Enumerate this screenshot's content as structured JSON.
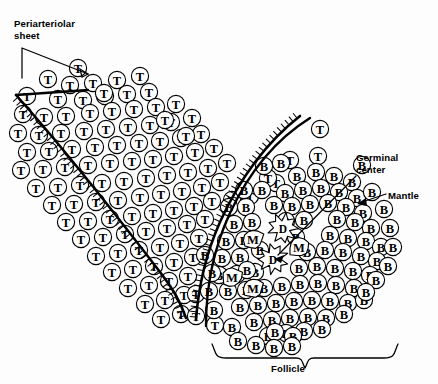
{
  "diagram": {
    "background_color": "#fdfdfd",
    "ink_color": "#000000",
    "width": 438,
    "height": 384
  },
  "labels": {
    "periarteriolar": "Periarteriolar\nsheet",
    "germinal_center": "Germinal\ncenter",
    "mantle": "Mantle",
    "follicle": "Follicle"
  },
  "legend_keys": {
    "T": "T lymphocyte",
    "B": "B lymphocyte",
    "M": "Macrophage",
    "D": "Dendritic cell"
  },
  "chart_data": {
    "type": "scatter",
    "xlabel": "",
    "ylabel": "",
    "xlim": [
      0,
      438
    ],
    "ylim": [
      0,
      384
    ],
    "grid": false,
    "legend_position": "none",
    "series": [
      {
        "name": "T lymphocyte",
        "marker": "circle",
        "label": "T",
        "radius": 8.6,
        "count": 118,
        "points": [
          [
            78,
            68
          ],
          [
            48,
            79
          ],
          [
            70,
            85
          ],
          [
            93,
            83
          ],
          [
            117,
            80
          ],
          [
            27,
            96
          ],
          [
            58,
            99
          ],
          [
            83,
            100
          ],
          [
            105,
            96
          ],
          [
            127,
            94
          ],
          [
            149,
            92
          ],
          [
            23,
            114
          ],
          [
            44,
            117
          ],
          [
            66,
            116
          ],
          [
            90,
            113
          ],
          [
            112,
            111
          ],
          [
            134,
            109
          ],
          [
            156,
            107
          ],
          [
            176,
            104
          ],
          [
            18,
            133
          ],
          [
            39,
            135
          ],
          [
            61,
            133
          ],
          [
            84,
            131
          ],
          [
            106,
            129
          ],
          [
            128,
            127
          ],
          [
            150,
            125
          ],
          [
            171,
            122
          ],
          [
            192,
            118
          ],
          [
            27,
            152
          ],
          [
            49,
            151
          ],
          [
            72,
            149
          ],
          [
            95,
            147
          ],
          [
            117,
            145
          ],
          [
            139,
            143
          ],
          [
            160,
            141
          ],
          [
            181,
            138
          ],
          [
            201,
            134
          ],
          [
            21,
            170
          ],
          [
            43,
            169
          ],
          [
            65,
            167
          ],
          [
            88,
            165
          ],
          [
            110,
            163
          ],
          [
            132,
            161
          ],
          [
            153,
            159
          ],
          [
            174,
            156
          ],
          [
            195,
            152
          ],
          [
            214,
            148
          ],
          [
            36,
            188
          ],
          [
            58,
            187
          ],
          [
            80,
            185
          ],
          [
            102,
            183
          ],
          [
            124,
            181
          ],
          [
            146,
            178
          ],
          [
            167,
            175
          ],
          [
            188,
            172
          ],
          [
            208,
            168
          ],
          [
            227,
            163
          ],
          [
            52,
            205
          ],
          [
            74,
            204
          ],
          [
            96,
            202
          ],
          [
            118,
            200
          ],
          [
            140,
            197
          ],
          [
            161,
            194
          ],
          [
            182,
            191
          ],
          [
            202,
            187
          ],
          [
            220,
            182
          ],
          [
            66,
            222
          ],
          [
            88,
            221
          ],
          [
            110,
            219
          ],
          [
            132,
            216
          ],
          [
            153,
            213
          ],
          [
            174,
            210
          ],
          [
            194,
            206
          ],
          [
            212,
            201
          ],
          [
            81,
            239
          ],
          [
            103,
            237
          ],
          [
            125,
            234
          ],
          [
            146,
            231
          ],
          [
            167,
            228
          ],
          [
            187,
            224
          ],
          [
            205,
            219
          ],
          [
            96,
            256
          ],
          [
            118,
            253
          ],
          [
            139,
            250
          ],
          [
            160,
            247
          ],
          [
            180,
            243
          ],
          [
            199,
            238
          ],
          [
            112,
            272
          ],
          [
            133,
            269
          ],
          [
            154,
            266
          ],
          [
            174,
            262
          ],
          [
            193,
            257
          ],
          [
            128,
            288
          ],
          [
            149,
            285
          ],
          [
            169,
            281
          ],
          [
            188,
            276
          ],
          [
            145,
            304
          ],
          [
            165,
            300
          ],
          [
            184,
            295
          ],
          [
            161,
            319
          ],
          [
            181,
            314
          ],
          [
            104,
            93
          ],
          [
            140,
            76
          ],
          [
            165,
            120
          ],
          [
            186,
            136
          ],
          [
            320,
            129
          ],
          [
            318,
            156
          ],
          [
            290,
            160
          ],
          [
            276,
            183
          ],
          [
            196,
            294
          ],
          [
            196,
            316
          ],
          [
            215,
            325
          ],
          [
            232,
            200
          ],
          [
            250,
            196
          ],
          [
            268,
            178
          ]
        ]
      },
      {
        "name": "B lymphocyte",
        "marker": "circle",
        "label": "B",
        "radius": 8.6,
        "count": 96,
        "points": [
          [
            297,
            176
          ],
          [
            316,
            172
          ],
          [
            334,
            176
          ],
          [
            352,
            182
          ],
          [
            285,
            193
          ],
          [
            303,
            190
          ],
          [
            321,
            188
          ],
          [
            339,
            192
          ],
          [
            357,
            198
          ],
          [
            246,
            207
          ],
          [
            274,
            205
          ],
          [
            292,
            206
          ],
          [
            310,
            204
          ],
          [
            328,
            203
          ],
          [
            346,
            207
          ],
          [
            363,
            213
          ],
          [
            234,
            224
          ],
          [
            252,
            222
          ],
          [
            286,
            221
          ],
          [
            304,
            220
          ],
          [
            337,
            219
          ],
          [
            355,
            222
          ],
          [
            371,
            228
          ],
          [
            226,
            241
          ],
          [
            244,
            240
          ],
          [
            296,
            237
          ],
          [
            330,
            235
          ],
          [
            348,
            238
          ],
          [
            366,
            241
          ],
          [
            381,
            247
          ],
          [
            222,
            258
          ],
          [
            240,
            257
          ],
          [
            307,
            252
          ],
          [
            325,
            250
          ],
          [
            343,
            252
          ],
          [
            361,
            256
          ],
          [
            377,
            261
          ],
          [
            219,
            275
          ],
          [
            237,
            274
          ],
          [
            255,
            272
          ],
          [
            299,
            268
          ],
          [
            317,
            266
          ],
          [
            335,
            268
          ],
          [
            353,
            271
          ],
          [
            370,
            275
          ],
          [
            228,
            291
          ],
          [
            246,
            290
          ],
          [
            264,
            288
          ],
          [
            282,
            286
          ],
          [
            300,
            284
          ],
          [
            318,
            283
          ],
          [
            336,
            285
          ],
          [
            354,
            288
          ],
          [
            240,
            307
          ],
          [
            258,
            305
          ],
          [
            276,
            303
          ],
          [
            294,
            301
          ],
          [
            312,
            300
          ],
          [
            330,
            301
          ],
          [
            348,
            303
          ],
          [
            364,
            300
          ],
          [
            254,
            322
          ],
          [
            272,
            320
          ],
          [
            290,
            318
          ],
          [
            308,
            317
          ],
          [
            326,
            318
          ],
          [
            344,
            314
          ],
          [
            268,
            336
          ],
          [
            286,
            333
          ],
          [
            304,
            331
          ],
          [
            322,
            329
          ],
          [
            209,
            291
          ],
          [
            214,
            310
          ],
          [
            232,
            327
          ],
          [
            264,
            166
          ],
          [
            281,
            163
          ],
          [
            362,
            165
          ],
          [
            372,
            192
          ],
          [
            384,
            209
          ],
          [
            390,
            228
          ],
          [
            393,
            247
          ],
          [
            388,
            266
          ],
          [
            244,
            190
          ],
          [
            262,
            190
          ],
          [
            229,
            207
          ],
          [
            260,
            250
          ],
          [
            247,
            270
          ],
          [
            275,
            332
          ],
          [
            293,
            336
          ],
          [
            212,
            273
          ],
          [
            205,
            255
          ],
          [
            238,
            341
          ],
          [
            256,
            345
          ],
          [
            274,
            348
          ],
          [
            292,
            346
          ],
          [
            376,
            280
          ],
          [
            366,
            292
          ]
        ]
      },
      {
        "name": "Macrophage",
        "marker": "blob",
        "label": "M",
        "radius": 9.2,
        "count": 4,
        "points": [
          [
            253,
            239
          ],
          [
            299,
            247
          ],
          [
            232,
            277
          ],
          [
            253,
            288
          ]
        ]
      },
      {
        "name": "Dendritic cell",
        "marker": "star",
        "label": "D",
        "radius": 15.5,
        "count": 2,
        "points": [
          [
            283,
            228
          ],
          [
            273,
            259
          ]
        ]
      }
    ],
    "annotations": [
      {
        "text": "Periarteriolar sheet",
        "target": [
          95,
          73
        ],
        "anchor": [
          22,
          48
        ]
      },
      {
        "text": "Germinal center",
        "target": [
          272,
          259
        ],
        "anchor": [
          356,
          176
        ]
      },
      {
        "text": "Mantle",
        "target": [
          357,
          200
        ],
        "anchor": [
          386,
          194
        ]
      },
      {
        "text": "Follicle",
        "target": [
          305,
          372
        ],
        "anchor": [
          305,
          360
        ]
      }
    ],
    "boundaries": [
      {
        "name": "sheath-left",
        "hatched": true
      },
      {
        "name": "sheath-right-inner",
        "hatched": true
      },
      {
        "name": "follicle-outer",
        "hatched": false
      }
    ]
  }
}
